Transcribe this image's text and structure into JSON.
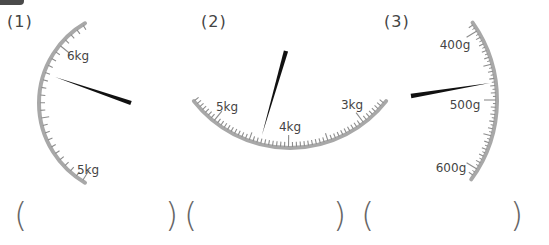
{
  "questions": [
    {
      "label": "(1)",
      "scale": {
        "major_labels": [
          "6kg",
          "5kg"
        ],
        "unit": "kg"
      },
      "answer": ""
    },
    {
      "label": "(2)",
      "scale": {
        "major_labels": [
          "5kg",
          "4kg",
          "3kg"
        ],
        "unit": "kg"
      },
      "answer": ""
    },
    {
      "label": "(3)",
      "scale": {
        "major_labels": [
          "400g",
          "500g",
          "600g"
        ],
        "unit": "g"
      },
      "answer": ""
    }
  ],
  "answer_brackets": {
    "open": "(",
    "close": ")"
  },
  "colors": {
    "arc": "#a8a8a8",
    "tick": "#8c8c8c",
    "needle": "#111111",
    "text": "#444444"
  }
}
